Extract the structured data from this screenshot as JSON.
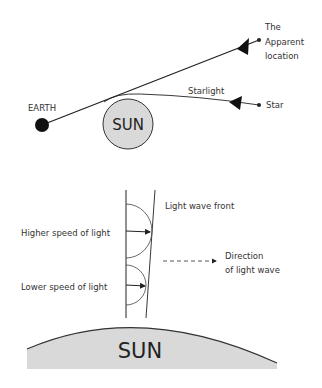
{
  "diagram": {
    "top": {
      "earth_label": "EARTH",
      "sun_label": "SUN",
      "starlight_label": "Starlight",
      "star_label": "Star",
      "apparent_location_lines": [
        "The",
        "Apparent",
        "location"
      ]
    },
    "bottom": {
      "wave_front_label": "Light wave front",
      "higher_speed_label": "Higher speed of light",
      "lower_speed_label": "Lower speed of light",
      "direction_lines": [
        "Direction",
        "of light wave"
      ],
      "sun_label": "SUN"
    },
    "colors": {
      "line": "#222222",
      "sun_fill": "#d9d9d9",
      "earth_fill": "#111111"
    }
  }
}
